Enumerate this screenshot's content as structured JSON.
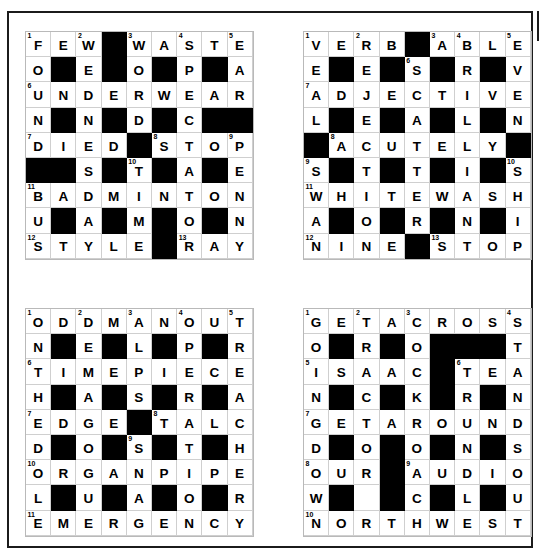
{
  "page": {
    "background_color": "#ffffff",
    "border_color": "#1b1b1b",
    "block_color": "#000000",
    "cell_color": "#ffffff",
    "gridline_color": "#cfcfcf",
    "grid_size": 9,
    "grid_count": 4
  },
  "grids": [
    {
      "id": "grid-1",
      "position": "top-left",
      "rows": [
        [
          {
            "letter": "F",
            "num": "1"
          },
          {
            "letter": "E"
          },
          {
            "letter": "W",
            "num": "2"
          },
          {
            "block": true
          },
          {
            "letter": "W",
            "num": "3"
          },
          {
            "letter": "A"
          },
          {
            "letter": "S",
            "num": "4"
          },
          {
            "letter": "T"
          },
          {
            "letter": "E",
            "num": "5"
          }
        ],
        [
          {
            "letter": "O"
          },
          {
            "block": true
          },
          {
            "letter": "E"
          },
          {
            "block": true
          },
          {
            "letter": "O"
          },
          {
            "block": true
          },
          {
            "letter": "P"
          },
          {
            "block": true
          },
          {
            "letter": "A"
          }
        ],
        [
          {
            "letter": "U",
            "num": "6"
          },
          {
            "letter": "N"
          },
          {
            "letter": "D"
          },
          {
            "letter": "E"
          },
          {
            "letter": "R"
          },
          {
            "letter": "W"
          },
          {
            "letter": "E"
          },
          {
            "letter": "A"
          },
          {
            "letter": "R"
          }
        ],
        [
          {
            "letter": "N"
          },
          {
            "block": true
          },
          {
            "letter": "N"
          },
          {
            "block": true
          },
          {
            "letter": "D"
          },
          {
            "block": true
          },
          {
            "letter": "C"
          },
          {
            "block": true
          },
          {
            "block": true
          }
        ],
        [
          {
            "letter": "D",
            "num": "7"
          },
          {
            "letter": "I"
          },
          {
            "letter": "E"
          },
          {
            "letter": "D"
          },
          {
            "block": true
          },
          {
            "letter": "S",
            "num": "8"
          },
          {
            "letter": "T"
          },
          {
            "letter": "O"
          },
          {
            "letter": "P",
            "num": "9"
          }
        ],
        [
          {
            "block": true
          },
          {
            "block": true
          },
          {
            "letter": "S"
          },
          {
            "block": true
          },
          {
            "letter": "T",
            "num": "10"
          },
          {
            "block": true
          },
          {
            "letter": "A"
          },
          {
            "block": true
          },
          {
            "letter": "E"
          }
        ],
        [
          {
            "letter": "B",
            "num": "11"
          },
          {
            "letter": "A"
          },
          {
            "letter": "D"
          },
          {
            "letter": "M"
          },
          {
            "letter": "I"
          },
          {
            "letter": "N"
          },
          {
            "letter": "T"
          },
          {
            "letter": "O"
          },
          {
            "letter": "N"
          }
        ],
        [
          {
            "letter": "U"
          },
          {
            "block": true
          },
          {
            "letter": "A"
          },
          {
            "block": true
          },
          {
            "letter": "M"
          },
          {
            "block": true
          },
          {
            "letter": "O"
          },
          {
            "block": true
          },
          {
            "letter": "N"
          }
        ],
        [
          {
            "letter": "S",
            "num": "12"
          },
          {
            "letter": "T"
          },
          {
            "letter": "Y"
          },
          {
            "letter": "L"
          },
          {
            "letter": "E"
          },
          {
            "block": true
          },
          {
            "letter": "R",
            "num": "13"
          },
          {
            "letter": "A"
          },
          {
            "letter": "Y"
          }
        ]
      ]
    },
    {
      "id": "grid-2",
      "position": "top-right",
      "rows": [
        [
          {
            "letter": "V",
            "num": "1"
          },
          {
            "letter": "E"
          },
          {
            "letter": "R",
            "num": "2"
          },
          {
            "letter": "B"
          },
          {
            "block": true
          },
          {
            "letter": "A",
            "num": "3"
          },
          {
            "letter": "B",
            "num": "4"
          },
          {
            "letter": "L"
          },
          {
            "letter": "E",
            "num": "5"
          }
        ],
        [
          {
            "letter": "E"
          },
          {
            "block": true
          },
          {
            "letter": "E"
          },
          {
            "block": true
          },
          {
            "letter": "S",
            "num": "6"
          },
          {
            "block": true
          },
          {
            "letter": "R"
          },
          {
            "block": true
          },
          {
            "letter": "V"
          }
        ],
        [
          {
            "letter": "A",
            "num": "7"
          },
          {
            "letter": "D"
          },
          {
            "letter": "J"
          },
          {
            "letter": "E"
          },
          {
            "letter": "C"
          },
          {
            "letter": "T"
          },
          {
            "letter": "I"
          },
          {
            "letter": "V"
          },
          {
            "letter": "E"
          }
        ],
        [
          {
            "letter": "L"
          },
          {
            "block": true
          },
          {
            "letter": "E"
          },
          {
            "block": true
          },
          {
            "letter": "A"
          },
          {
            "block": true
          },
          {
            "letter": "L"
          },
          {
            "block": true
          },
          {
            "letter": "N"
          }
        ],
        [
          {
            "block": true
          },
          {
            "letter": "A",
            "num": "8"
          },
          {
            "letter": "C"
          },
          {
            "letter": "U"
          },
          {
            "letter": "T"
          },
          {
            "letter": "E"
          },
          {
            "letter": "L"
          },
          {
            "letter": "Y"
          },
          {
            "block": true
          }
        ],
        [
          {
            "letter": "S",
            "num": "9"
          },
          {
            "block": true
          },
          {
            "letter": "T"
          },
          {
            "block": true
          },
          {
            "letter": "T"
          },
          {
            "block": true
          },
          {
            "letter": "I"
          },
          {
            "block": true
          },
          {
            "letter": "S",
            "num": "10"
          }
        ],
        [
          {
            "letter": "W",
            "num": "11"
          },
          {
            "letter": "H"
          },
          {
            "letter": "I"
          },
          {
            "letter": "T"
          },
          {
            "letter": "E"
          },
          {
            "letter": "W"
          },
          {
            "letter": "A"
          },
          {
            "letter": "S"
          },
          {
            "letter": "H"
          }
        ],
        [
          {
            "letter": "A"
          },
          {
            "block": true
          },
          {
            "letter": "O"
          },
          {
            "block": true
          },
          {
            "letter": "R"
          },
          {
            "block": true
          },
          {
            "letter": "N"
          },
          {
            "block": true
          },
          {
            "letter": "I"
          }
        ],
        [
          {
            "letter": "N",
            "num": "12"
          },
          {
            "letter": "I"
          },
          {
            "letter": "N"
          },
          {
            "letter": "E"
          },
          {
            "block": true
          },
          {
            "letter": "S",
            "num": "13"
          },
          {
            "letter": "T"
          },
          {
            "letter": "O"
          },
          {
            "letter": "P"
          }
        ]
      ]
    },
    {
      "id": "grid-3",
      "position": "bottom-left",
      "rows": [
        [
          {
            "letter": "O",
            "num": "1"
          },
          {
            "letter": "D"
          },
          {
            "letter": "D",
            "num": "2"
          },
          {
            "letter": "M"
          },
          {
            "letter": "A",
            "num": "3"
          },
          {
            "letter": "N"
          },
          {
            "letter": "O",
            "num": "4"
          },
          {
            "letter": "U"
          },
          {
            "letter": "T",
            "num": "5"
          }
        ],
        [
          {
            "letter": "N"
          },
          {
            "block": true
          },
          {
            "letter": "E"
          },
          {
            "block": true
          },
          {
            "letter": "L"
          },
          {
            "block": true
          },
          {
            "letter": "P"
          },
          {
            "block": true
          },
          {
            "letter": "R"
          }
        ],
        [
          {
            "letter": "T",
            "num": "6"
          },
          {
            "letter": "I"
          },
          {
            "letter": "M"
          },
          {
            "letter": "E"
          },
          {
            "letter": "P"
          },
          {
            "letter": "I"
          },
          {
            "letter": "E"
          },
          {
            "letter": "C"
          },
          {
            "letter": "E"
          }
        ],
        [
          {
            "letter": "H"
          },
          {
            "block": true
          },
          {
            "letter": "A"
          },
          {
            "block": true
          },
          {
            "letter": "S"
          },
          {
            "block": true
          },
          {
            "letter": "R"
          },
          {
            "block": true
          },
          {
            "letter": "A"
          }
        ],
        [
          {
            "letter": "E",
            "num": "7"
          },
          {
            "letter": "D"
          },
          {
            "letter": "G"
          },
          {
            "letter": "E"
          },
          {
            "block": true
          },
          {
            "letter": "T",
            "num": "8"
          },
          {
            "letter": "A"
          },
          {
            "letter": "L"
          },
          {
            "letter": "C"
          }
        ],
        [
          {
            "letter": "D"
          },
          {
            "block": true
          },
          {
            "letter": "O"
          },
          {
            "block": true
          },
          {
            "letter": "S",
            "num": "9"
          },
          {
            "block": true
          },
          {
            "letter": "T"
          },
          {
            "block": true
          },
          {
            "letter": "H"
          }
        ],
        [
          {
            "letter": "O",
            "num": "10"
          },
          {
            "letter": "R"
          },
          {
            "letter": "G"
          },
          {
            "letter": "A"
          },
          {
            "letter": "N"
          },
          {
            "letter": "P"
          },
          {
            "letter": "I"
          },
          {
            "letter": "P"
          },
          {
            "letter": "E"
          }
        ],
        [
          {
            "letter": "L"
          },
          {
            "block": true
          },
          {
            "letter": "U"
          },
          {
            "block": true
          },
          {
            "letter": "A"
          },
          {
            "block": true
          },
          {
            "letter": "O"
          },
          {
            "block": true
          },
          {
            "letter": "R"
          }
        ],
        [
          {
            "letter": "E",
            "num": "11"
          },
          {
            "letter": "M"
          },
          {
            "letter": "E"
          },
          {
            "letter": "R"
          },
          {
            "letter": "G"
          },
          {
            "letter": "E"
          },
          {
            "letter": "N"
          },
          {
            "letter": "C"
          },
          {
            "letter": "Y"
          }
        ]
      ]
    },
    {
      "id": "grid-4",
      "position": "bottom-right",
      "rows": [
        [
          {
            "letter": "G",
            "num": "1"
          },
          {
            "letter": "E"
          },
          {
            "letter": "T",
            "num": "2"
          },
          {
            "letter": "A"
          },
          {
            "letter": "C",
            "num": "3"
          },
          {
            "letter": "R"
          },
          {
            "letter": "O"
          },
          {
            "letter": "S"
          },
          {
            "letter": "S",
            "num": "4"
          }
        ],
        [
          {
            "letter": "O"
          },
          {
            "block": true
          },
          {
            "letter": "R"
          },
          {
            "block": true
          },
          {
            "letter": "O"
          },
          {
            "block": true
          },
          {
            "block": true
          },
          {
            "block": true
          },
          {
            "letter": "T"
          }
        ],
        [
          {
            "letter": "I",
            "num": "5"
          },
          {
            "letter": "S"
          },
          {
            "letter": "A"
          },
          {
            "letter": "A"
          },
          {
            "letter": "C"
          },
          {
            "block": true
          },
          {
            "letter": "T",
            "num": "6"
          },
          {
            "letter": "E"
          },
          {
            "letter": "A"
          }
        ],
        [
          {
            "letter": "N"
          },
          {
            "block": true
          },
          {
            "letter": "C"
          },
          {
            "block": true
          },
          {
            "letter": "K"
          },
          {
            "block": true
          },
          {
            "letter": "R"
          },
          {
            "block": true
          },
          {
            "letter": "N"
          }
        ],
        [
          {
            "letter": "G",
            "num": "7"
          },
          {
            "letter": "E"
          },
          {
            "letter": "T"
          },
          {
            "letter": "A"
          },
          {
            "letter": "R"
          },
          {
            "letter": "O"
          },
          {
            "letter": "U"
          },
          {
            "letter": "N"
          },
          {
            "letter": "D"
          }
        ],
        [
          {
            "letter": "D"
          },
          {
            "block": true
          },
          {
            "letter": "O"
          },
          {
            "block": true
          },
          {
            "letter": "O"
          },
          {
            "block": true
          },
          {
            "letter": "N"
          },
          {
            "block": true
          },
          {
            "letter": "S"
          }
        ],
        [
          {
            "letter": "O",
            "num": "8"
          },
          {
            "letter": "U"
          },
          {
            "letter": "R"
          },
          {
            "block": true
          },
          {
            "letter": "A",
            "num": "9"
          },
          {
            "letter": "U"
          },
          {
            "letter": "D"
          },
          {
            "letter": "I"
          },
          {
            "letter": "O"
          }
        ],
        [
          {
            "letter": "W"
          },
          {
            "block": true
          },
          {
            "letter": ""
          },
          {
            "block": true
          },
          {
            "letter": "C"
          },
          {
            "block": true
          },
          {
            "letter": "L"
          },
          {
            "block": true
          },
          {
            "letter": "U"
          }
        ],
        [
          {
            "letter": "N",
            "num": "10"
          },
          {
            "letter": "O"
          },
          {
            "letter": "R"
          },
          {
            "letter": "T"
          },
          {
            "letter": "H"
          },
          {
            "letter": "W"
          },
          {
            "letter": "E"
          },
          {
            "letter": "S"
          },
          {
            "letter": "T"
          }
        ]
      ]
    }
  ]
}
